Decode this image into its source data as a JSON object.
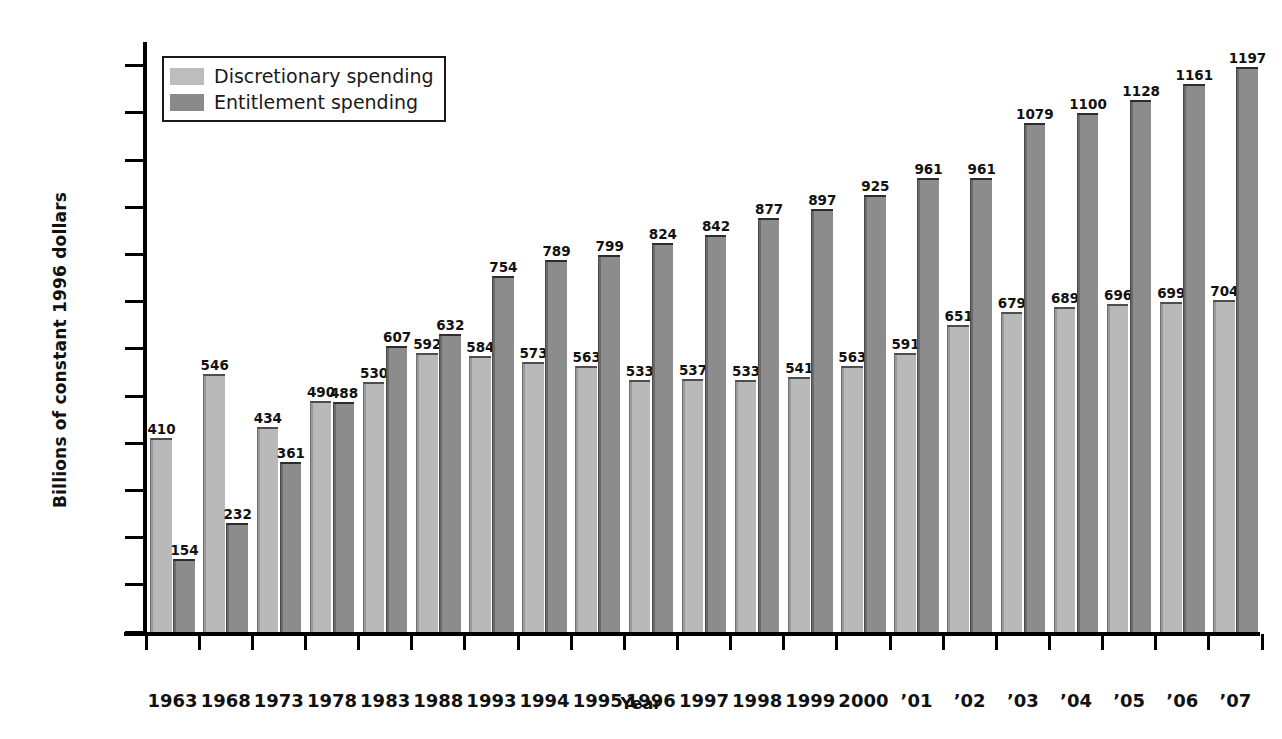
{
  "chart_data": {
    "type": "bar",
    "title": "",
    "xlabel": "Year",
    "ylabel": "Billions of constant 1996 dollars",
    "ylim": [
      0,
      1250
    ],
    "ytick_values": [
      0,
      100,
      200,
      300,
      400,
      500,
      600,
      700,
      800,
      900,
      1000,
      1100,
      1200
    ],
    "ytick_labels": [
      "0",
      "100",
      "200",
      "300",
      "400",
      "500",
      "600",
      "700",
      "800",
      "900",
      "1000",
      "1100",
      "1200"
    ],
    "grid": false,
    "legend_position": "top-left",
    "categories": [
      "1963",
      "1968",
      "1973",
      "1978",
      "1983",
      "1988",
      "1993",
      "1994",
      "1995",
      "1996",
      "1997",
      "1998",
      "1999",
      "2000",
      "’01",
      "’02",
      "’03",
      "’04",
      "’05",
      "’06",
      "’07"
    ],
    "series": [
      {
        "name": "Discretionary spending",
        "color": "#bdbdbd",
        "values": [
          410,
          546,
          434,
          490,
          530,
          592,
          584,
          573,
          563,
          533,
          537,
          533,
          541,
          563,
          591,
          651,
          679,
          689,
          696,
          699,
          704
        ]
      },
      {
        "name": "Entitlement spending",
        "color": "#8a8a8a",
        "values": [
          154,
          232,
          361,
          488,
          607,
          632,
          754,
          789,
          799,
          824,
          842,
          877,
          897,
          925,
          961,
          961,
          1079,
          1100,
          1128,
          1161,
          1197
        ]
      }
    ]
  },
  "legend": {
    "items": [
      {
        "label": "Discretionary spending",
        "swatch_class": "disc"
      },
      {
        "label": "Entitlement spending",
        "swatch_class": "ent"
      }
    ]
  },
  "axes": {
    "y_title": "Billions of constant 1996 dollars",
    "x_title": "Year"
  }
}
